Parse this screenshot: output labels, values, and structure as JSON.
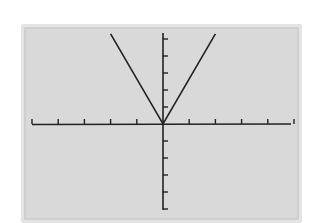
{
  "chart_data": {
    "type": "line",
    "title": "",
    "xlabel": "",
    "ylabel": "",
    "function": "absolute value (V shape, vertex at origin)",
    "series": [
      {
        "name": "graph",
        "x": [
          -2,
          0,
          2
        ],
        "y": [
          5.3,
          0,
          5.3
        ]
      }
    ],
    "x_ticks": [
      -5,
      -4,
      -3,
      -2,
      -1,
      1,
      2,
      3,
      4,
      5
    ],
    "y_ticks": [
      -5,
      -4,
      -3,
      -2,
      -1,
      1,
      2,
      3,
      4,
      5
    ],
    "xlim": [
      -5.2,
      4.9
    ],
    "ylim": [
      -5.1,
      5.4
    ],
    "grid": false,
    "legend": null
  },
  "colors": {
    "screen": "#d9d9d9",
    "line": "#222222"
  }
}
